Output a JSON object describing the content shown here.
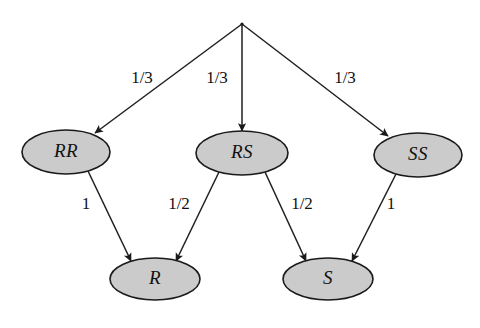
{
  "diagram": {
    "type": "probability-tree",
    "title": "",
    "background_color": "#ffffff",
    "node_fill_color": "#cbcbcb",
    "node_stroke_color": "#1a1a1a",
    "edge_color": "#1f1f1f",
    "root": {
      "name": "root-node",
      "label": "",
      "x": 242,
      "y": 24
    },
    "nodes": [
      {
        "id": "RR",
        "label": "RR",
        "cx": 66,
        "cy": 152,
        "rx": 44,
        "ry": 22
      },
      {
        "id": "RS",
        "label": "RS",
        "cx": 242,
        "cy": 153,
        "rx": 46,
        "ry": 22
      },
      {
        "id": "SS",
        "label": "SS",
        "cx": 418,
        "cy": 155,
        "rx": 44,
        "ry": 22
      },
      {
        "id": "R",
        "label": "R",
        "cx": 155,
        "cy": 279,
        "rx": 45,
        "ry": 21
      },
      {
        "id": "S",
        "label": "S",
        "cx": 328,
        "cy": 279,
        "rx": 45,
        "ry": 21
      }
    ],
    "edges": [
      {
        "id": "root-RR",
        "from": "root",
        "to": "RR",
        "label": "1/3",
        "label_x": 142,
        "label_y": 79,
        "x1": 242,
        "y1": 24,
        "x2": 95,
        "y2": 133
      },
      {
        "id": "root-RS",
        "from": "root",
        "to": "RS",
        "label": "1/3",
        "label_x": 217,
        "label_y": 79,
        "x1": 242,
        "y1": 24,
        "x2": 242,
        "y2": 131
      },
      {
        "id": "root-SS",
        "from": "root",
        "to": "SS",
        "label": "1/3",
        "label_x": 345,
        "label_y": 79,
        "x1": 242,
        "y1": 24,
        "x2": 388,
        "y2": 136
      },
      {
        "id": "RR-R",
        "from": "RR",
        "to": "R",
        "label": "1",
        "label_x": 86,
        "label_y": 205,
        "x1": 88,
        "y1": 171,
        "x2": 131,
        "y2": 261
      },
      {
        "id": "RS-R",
        "from": "RS",
        "to": "R",
        "label": "1/2",
        "label_x": 179,
        "label_y": 205,
        "x1": 219,
        "y1": 172,
        "x2": 176,
        "y2": 261
      },
      {
        "id": "RS-S",
        "from": "RS",
        "to": "S",
        "label": "1/2",
        "label_x": 302,
        "label_y": 205,
        "x1": 265,
        "y1": 172,
        "x2": 306,
        "y2": 261
      },
      {
        "id": "SS-S",
        "from": "SS",
        "to": "S",
        "label": "1",
        "label_x": 391,
        "label_y": 205,
        "x1": 396,
        "y1": 174,
        "x2": 352,
        "y2": 261
      }
    ]
  }
}
